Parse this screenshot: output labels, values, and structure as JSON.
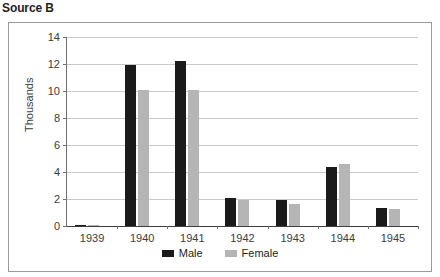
{
  "page_title": "Source B",
  "chart_data": {
    "type": "bar",
    "title": "",
    "xlabel": "",
    "ylabel": "Thousands",
    "ylim": [
      0,
      14
    ],
    "yticks": [
      0,
      2,
      4,
      6,
      8,
      10,
      12,
      14
    ],
    "grid": true,
    "legend_position": "bottom",
    "categories": [
      "1939",
      "1940",
      "1941",
      "1942",
      "1943",
      "1944",
      "1945"
    ],
    "series": [
      {
        "name": "Male",
        "color": "#1a1a1a",
        "values": [
          0.1,
          11.9,
          12.2,
          2.1,
          1.9,
          4.4,
          1.35
        ]
      },
      {
        "name": "Female",
        "color": "#b5b5b5",
        "values": [
          0.08,
          10.1,
          10.1,
          1.95,
          1.6,
          4.6,
          1.25
        ]
      }
    ]
  }
}
